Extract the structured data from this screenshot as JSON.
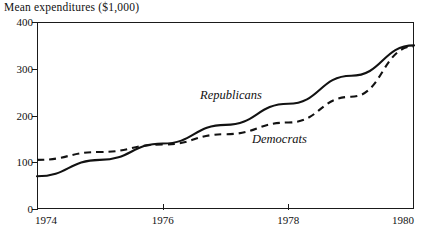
{
  "chart_data": {
    "type": "line",
    "title": "",
    "ylabel": "Mean expenditures ($1,000)",
    "xlabel": "",
    "xlim": [
      1974,
      1980
    ],
    "ylim": [
      0,
      400
    ],
    "grid": false,
    "legend_position": "inline-annotations",
    "x_ticks": [
      "1974",
      "1976",
      "1978",
      "1980"
    ],
    "x_tick_values": [
      1974,
      1976,
      1978,
      1980
    ],
    "y_ticks": [
      "0",
      "100",
      "200",
      "300",
      "400"
    ],
    "y_tick_values": [
      0,
      100,
      200,
      300,
      400
    ],
    "x": [
      1974,
      1975,
      1976,
      1977,
      1978,
      1979,
      1980
    ],
    "series": [
      {
        "name": "Republicans",
        "style": "solid",
        "color": "#121212",
        "values": [
          70,
          105,
          140,
          180,
          225,
          285,
          350
        ]
      },
      {
        "name": "Democrats",
        "style": "dashed",
        "color": "#121212",
        "values": [
          105,
          122,
          138,
          160,
          185,
          240,
          348
        ]
      }
    ],
    "annotations": [
      {
        "text": "Republicans",
        "x": 1977.1,
        "y": 258
      },
      {
        "text": "Democrats",
        "x": 1977.9,
        "y": 150
      }
    ]
  },
  "axis": {
    "y_title": "Mean expenditures ($1,000)"
  },
  "artifact": {
    "text": ""
  }
}
